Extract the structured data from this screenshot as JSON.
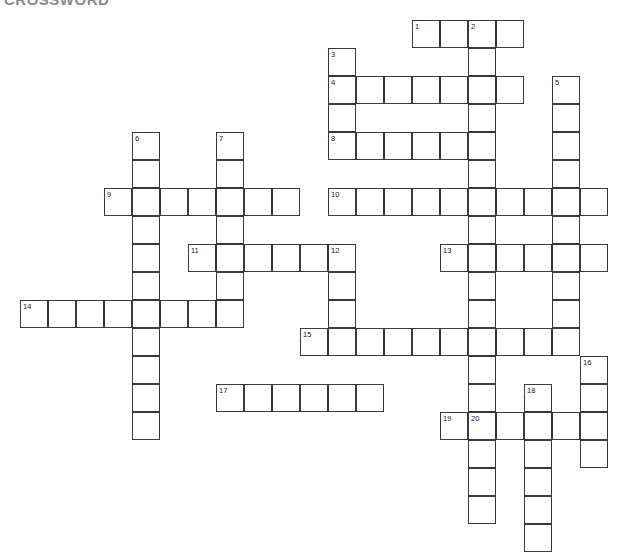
{
  "title": "CROSSWORD",
  "grid": {
    "cell_size": 28,
    "origin_x": 20,
    "origin_y": 20,
    "border_color": "#3a3a3a",
    "cell_color": "#ffffff",
    "background": "#ffffff",
    "columns": 21,
    "rows": 19,
    "total_cells": 133,
    "numbered_clues": 20
  },
  "entries": [
    {
      "number": 1,
      "direction": "across",
      "col": 14,
      "row": 0,
      "length": 4
    },
    {
      "number": 2,
      "direction": "down",
      "col": 16,
      "row": 0,
      "length": 11
    },
    {
      "number": 3,
      "direction": "down",
      "col": 11,
      "row": 1,
      "length": 4
    },
    {
      "number": 4,
      "direction": "across",
      "col": 11,
      "row": 2,
      "length": 7
    },
    {
      "number": 5,
      "direction": "down",
      "col": 19,
      "row": 2,
      "length": 7
    },
    {
      "number": 6,
      "direction": "down",
      "col": 4,
      "row": 4,
      "length": 11
    },
    {
      "number": 7,
      "direction": "down",
      "col": 7,
      "row": 4,
      "length": 7
    },
    {
      "number": 8,
      "direction": "across",
      "col": 11,
      "row": 4,
      "length": 5
    },
    {
      "number": 9,
      "direction": "across",
      "col": 3,
      "row": 6,
      "length": 7
    },
    {
      "number": 10,
      "direction": "across",
      "col": 11,
      "row": 6,
      "length": 10
    },
    {
      "number": 11,
      "direction": "across",
      "col": 6,
      "row": 8,
      "length": 6
    },
    {
      "number": 12,
      "direction": "down",
      "col": 11,
      "row": 8,
      "length": 4
    },
    {
      "number": 13,
      "direction": "across",
      "col": 15,
      "row": 8,
      "length": 6
    },
    {
      "number": 14,
      "direction": "across",
      "col": 0,
      "row": 10,
      "length": 8
    },
    {
      "number": 15,
      "direction": "across",
      "col": 10,
      "row": 11,
      "length": 10
    },
    {
      "number": 16,
      "direction": "down",
      "col": 20,
      "row": 12,
      "length": 4
    },
    {
      "number": 17,
      "direction": "across",
      "col": 7,
      "row": 13,
      "length": 6
    },
    {
      "number": 18,
      "direction": "down",
      "col": 18,
      "row": 13,
      "length": 7
    },
    {
      "number": 19,
      "direction": "across",
      "col": 15,
      "row": 14,
      "length": 6
    },
    {
      "number": 20,
      "direction": "down",
      "col": 16,
      "row": 14,
      "length": 4
    }
  ],
  "cells": [
    {
      "c": 14,
      "r": 0,
      "n": 1
    },
    {
      "c": 15,
      "r": 0
    },
    {
      "c": 16,
      "r": 0,
      "n": 2
    },
    {
      "c": 17,
      "r": 0
    },
    {
      "c": 11,
      "r": 1,
      "n": 3
    },
    {
      "c": 16,
      "r": 1
    },
    {
      "c": 11,
      "r": 2,
      "n": 4
    },
    {
      "c": 12,
      "r": 2
    },
    {
      "c": 13,
      "r": 2
    },
    {
      "c": 14,
      "r": 2
    },
    {
      "c": 15,
      "r": 2
    },
    {
      "c": 16,
      "r": 2
    },
    {
      "c": 17,
      "r": 2
    },
    {
      "c": 19,
      "r": 2,
      "n": 5
    },
    {
      "c": 11,
      "r": 3
    },
    {
      "c": 16,
      "r": 3
    },
    {
      "c": 19,
      "r": 3
    },
    {
      "c": 11,
      "r": 4,
      "n": 8
    },
    {
      "c": 12,
      "r": 4
    },
    {
      "c": 13,
      "r": 4
    },
    {
      "c": 14,
      "r": 4
    },
    {
      "c": 15,
      "r": 4
    },
    {
      "c": 4,
      "r": 4,
      "n": 6
    },
    {
      "c": 7,
      "r": 4,
      "n": 7
    },
    {
      "c": 16,
      "r": 4
    },
    {
      "c": 19,
      "r": 4
    },
    {
      "c": 4,
      "r": 5
    },
    {
      "c": 7,
      "r": 5
    },
    {
      "c": 16,
      "r": 5
    },
    {
      "c": 19,
      "r": 5
    },
    {
      "c": 3,
      "r": 6,
      "n": 9
    },
    {
      "c": 4,
      "r": 6
    },
    {
      "c": 5,
      "r": 6
    },
    {
      "c": 6,
      "r": 6
    },
    {
      "c": 7,
      "r": 6
    },
    {
      "c": 8,
      "r": 6
    },
    {
      "c": 9,
      "r": 6
    },
    {
      "c": 11,
      "r": 6,
      "n": 10
    },
    {
      "c": 12,
      "r": 6
    },
    {
      "c": 13,
      "r": 6
    },
    {
      "c": 14,
      "r": 6
    },
    {
      "c": 15,
      "r": 6
    },
    {
      "c": 16,
      "r": 6
    },
    {
      "c": 17,
      "r": 6
    },
    {
      "c": 18,
      "r": 6
    },
    {
      "c": 19,
      "r": 6
    },
    {
      "c": 20,
      "r": 6
    },
    {
      "c": 4,
      "r": 7
    },
    {
      "c": 7,
      "r": 7
    },
    {
      "c": 16,
      "r": 7
    },
    {
      "c": 19,
      "r": 7
    },
    {
      "c": 6,
      "r": 8,
      "n": 11
    },
    {
      "c": 7,
      "r": 8
    },
    {
      "c": 8,
      "r": 8
    },
    {
      "c": 9,
      "r": 8
    },
    {
      "c": 10,
      "r": 8
    },
    {
      "c": 11,
      "r": 8,
      "n": 12
    },
    {
      "c": 4,
      "r": 8
    },
    {
      "c": 15,
      "r": 8,
      "n": 13
    },
    {
      "c": 16,
      "r": 8
    },
    {
      "c": 17,
      "r": 8
    },
    {
      "c": 18,
      "r": 8
    },
    {
      "c": 19,
      "r": 8
    },
    {
      "c": 20,
      "r": 8
    },
    {
      "c": 4,
      "r": 9
    },
    {
      "c": 7,
      "r": 9
    },
    {
      "c": 11,
      "r": 9
    },
    {
      "c": 16,
      "r": 9
    },
    {
      "c": 19,
      "r": 9
    },
    {
      "c": 0,
      "r": 10,
      "n": 14
    },
    {
      "c": 1,
      "r": 10
    },
    {
      "c": 2,
      "r": 10
    },
    {
      "c": 3,
      "r": 10
    },
    {
      "c": 4,
      "r": 10
    },
    {
      "c": 5,
      "r": 10
    },
    {
      "c": 6,
      "r": 10
    },
    {
      "c": 7,
      "r": 10
    },
    {
      "c": 11,
      "r": 10
    },
    {
      "c": 16,
      "r": 10
    },
    {
      "c": 19,
      "r": 10
    },
    {
      "c": 4,
      "r": 11
    },
    {
      "c": 11,
      "r": 11
    },
    {
      "c": 10,
      "r": 11,
      "n": 15
    },
    {
      "c": 12,
      "r": 11
    },
    {
      "c": 13,
      "r": 11
    },
    {
      "c": 14,
      "r": 11
    },
    {
      "c": 15,
      "r": 11
    },
    {
      "c": 16,
      "r": 11
    },
    {
      "c": 17,
      "r": 11
    },
    {
      "c": 18,
      "r": 11
    },
    {
      "c": 19,
      "r": 11
    },
    {
      "c": 4,
      "r": 12
    },
    {
      "c": 16,
      "r": 12
    },
    {
      "c": 20,
      "r": 12,
      "n": 16
    },
    {
      "c": 4,
      "r": 13
    },
    {
      "c": 16,
      "r": 13
    },
    {
      "c": 18,
      "r": 13,
      "n": 18
    },
    {
      "c": 20,
      "r": 13
    },
    {
      "c": 7,
      "r": 13,
      "n": 17
    },
    {
      "c": 8,
      "r": 13
    },
    {
      "c": 9,
      "r": 13
    },
    {
      "c": 10,
      "r": 13
    },
    {
      "c": 11,
      "r": 13
    },
    {
      "c": 12,
      "r": 13
    },
    {
      "c": 15,
      "r": 14,
      "n": 19
    },
    {
      "c": 16,
      "r": 14,
      "n": 20
    },
    {
      "c": 17,
      "r": 14
    },
    {
      "c": 18,
      "r": 14
    },
    {
      "c": 19,
      "r": 14
    },
    {
      "c": 20,
      "r": 14
    },
    {
      "c": 4,
      "r": 14
    },
    {
      "c": 16,
      "r": 15
    },
    {
      "c": 18,
      "r": 15
    },
    {
      "c": 20,
      "r": 15
    },
    {
      "c": 16,
      "r": 16
    },
    {
      "c": 18,
      "r": 16
    },
    {
      "c": 16,
      "r": 17
    },
    {
      "c": 18,
      "r": 17
    },
    {
      "c": 18,
      "r": 18
    }
  ],
  "letters": []
}
